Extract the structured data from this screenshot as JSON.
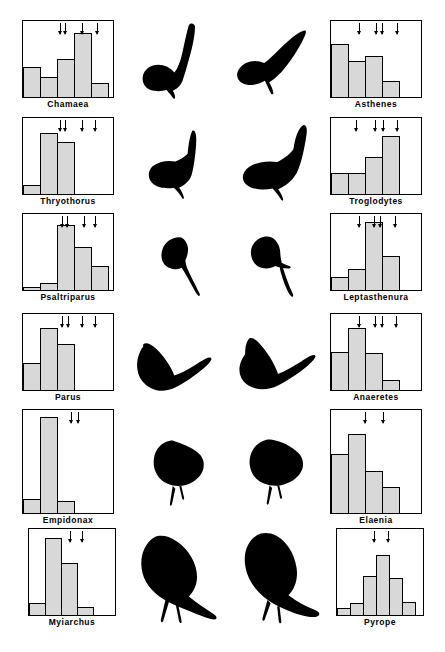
{
  "figure": {
    "accent_color": "#000000",
    "bar_fill_color": "#d8d8d8",
    "background_color": "#ffffff",
    "columns": {
      "left_label": "California genera",
      "right_label": "Chile genera"
    }
  },
  "chart_data": [
    {
      "type": "bar",
      "title": "Chamaea",
      "side": "left",
      "row": 1,
      "categories": [
        "1",
        "2",
        "3",
        "4",
        "5"
      ],
      "values": [
        40,
        27,
        52,
        86,
        19
      ],
      "ylim": [
        0,
        100
      ],
      "grid": false,
      "xlabel": "",
      "ylabel": "",
      "annotations": {
        "arrow_positions": [
          0.4,
          0.46,
          0.64,
          0.8
        ],
        "arrow_symbol": "down-arrow"
      }
    },
    {
      "type": "bar",
      "title": "Asthenes",
      "side": "right",
      "row": 1,
      "categories": [
        "1",
        "2",
        "3",
        "4"
      ],
      "values": [
        72,
        48,
        55,
        22
      ],
      "ylim": [
        0,
        100
      ],
      "grid": false,
      "xlabel": "",
      "ylabel": "",
      "annotations": {
        "arrow_positions": [
          0.3,
          0.49,
          0.55,
          0.72
        ],
        "arrow_symbol": "down-arrow"
      }
    },
    {
      "type": "bar",
      "title": "Thryothorus",
      "side": "left",
      "row": 2,
      "categories": [
        "1",
        "2",
        "3"
      ],
      "values": [
        12,
        82,
        70
      ],
      "ylim": [
        0,
        100
      ],
      "grid": false,
      "xlabel": "",
      "ylabel": "",
      "annotations": {
        "arrow_positions": [
          0.4,
          0.46,
          0.64,
          0.78
        ],
        "arrow_symbol": "down-arrow"
      }
    },
    {
      "type": "bar",
      "title": "Troglodytes",
      "side": "right",
      "row": 2,
      "categories": [
        "1",
        "2",
        "3",
        "4"
      ],
      "values": [
        28,
        28,
        50,
        78
      ],
      "ylim": [
        0,
        100
      ],
      "grid": false,
      "xlabel": "",
      "ylabel": "",
      "annotations": {
        "arrow_positions": [
          0.27,
          0.48,
          0.56,
          0.72
        ],
        "arrow_symbol": "down-arrow"
      }
    },
    {
      "type": "bar",
      "title": "Psaltriparus",
      "side": "left",
      "row": 3,
      "categories": [
        "1",
        "2",
        "3",
        "4",
        "5"
      ],
      "values": [
        4,
        10,
        88,
        58,
        32
      ],
      "ylim": [
        0,
        100
      ],
      "grid": false,
      "xlabel": "",
      "ylabel": "",
      "annotations": {
        "arrow_positions": [
          0.42,
          0.48,
          0.66,
          0.78
        ],
        "arrow_symbol": "down-arrow"
      }
    },
    {
      "type": "bar",
      "title": "Leptasthenura",
      "side": "right",
      "row": 3,
      "categories": [
        "1",
        "2",
        "3",
        "4"
      ],
      "values": [
        18,
        28,
        92,
        46
      ],
      "ylim": [
        0,
        100
      ],
      "grid": false,
      "xlabel": "",
      "ylabel": "",
      "annotations": {
        "arrow_positions": [
          0.3,
          0.47,
          0.53,
          0.7
        ],
        "arrow_symbol": "down-arrow"
      }
    },
    {
      "type": "bar",
      "title": "Parus",
      "side": "left",
      "row": 4,
      "categories": [
        "1",
        "2",
        "3"
      ],
      "values": [
        36,
        84,
        62
      ],
      "ylim": [
        0,
        100
      ],
      "grid": false,
      "xlabel": "",
      "ylabel": "",
      "annotations": {
        "arrow_positions": [
          0.42,
          0.49,
          0.64,
          0.78
        ],
        "arrow_symbol": "down-arrow"
      }
    },
    {
      "type": "bar",
      "title": "Anaeretes",
      "side": "right",
      "row": 4,
      "categories": [
        "1",
        "2",
        "3",
        "4"
      ],
      "values": [
        52,
        84,
        50,
        14
      ],
      "ylim": [
        0,
        100
      ],
      "grid": false,
      "xlabel": "",
      "ylabel": "",
      "annotations": {
        "arrow_positions": [
          0.3,
          0.48,
          0.55,
          0.71
        ],
        "arrow_symbol": "down-arrow"
      }
    },
    {
      "type": "bar",
      "title": "Empidonax",
      "side": "left",
      "row": 5,
      "categories": [
        "1",
        "2",
        "3"
      ],
      "values": [
        14,
        95,
        12
      ],
      "ylim": [
        0,
        100
      ],
      "grid": false,
      "xlabel": "",
      "ylabel": "",
      "annotations": {
        "arrow_positions": [
          0.52,
          0.6
        ],
        "arrow_symbol": "down-arrow"
      }
    },
    {
      "type": "bar",
      "title": "Elaenia",
      "side": "right",
      "row": 5,
      "categories": [
        "1",
        "2",
        "3",
        "4"
      ],
      "values": [
        58,
        78,
        42,
        26
      ],
      "ylim": [
        0,
        100
      ],
      "grid": false,
      "xlabel": "",
      "ylabel": "",
      "annotations": {
        "arrow_positions": [
          0.37,
          0.56
        ],
        "arrow_symbol": "down-arrow"
      }
    },
    {
      "type": "bar",
      "title": "Myiarchus",
      "side": "left",
      "row": 6,
      "categories": [
        "1",
        "2",
        "3",
        "4"
      ],
      "values": [
        14,
        92,
        62,
        10
      ],
      "ylim": [
        0,
        100
      ],
      "grid": false,
      "xlabel": "",
      "ylabel": "",
      "annotations": {
        "arrow_positions": [
          0.47,
          0.6
        ],
        "arrow_symbol": "down-arrow"
      }
    },
    {
      "type": "bar",
      "title": "Pyrope",
      "side": "right",
      "row": 6,
      "categories": [
        "1",
        "2",
        "3",
        "4",
        "5",
        "6"
      ],
      "values": [
        8,
        14,
        46,
        72,
        44,
        16
      ],
      "ylim": [
        0,
        100
      ],
      "grid": false,
      "xlabel": "",
      "ylabel": "",
      "annotations": {
        "arrow_positions": [
          0.42,
          0.58
        ],
        "arrow_symbol": "down-arrow"
      }
    }
  ],
  "silhouettes": [
    {
      "name": "wrentit-silhouette",
      "row": 1,
      "side": "left",
      "genus": "Chamaea"
    },
    {
      "name": "canastero-silhouette",
      "row": 1,
      "side": "right",
      "genus": "Asthenes"
    },
    {
      "name": "wren-silhouette",
      "row": 2,
      "side": "left",
      "genus": "Thryothorus"
    },
    {
      "name": "house-wren-silhouette",
      "row": 2,
      "side": "right",
      "genus": "Troglodytes"
    },
    {
      "name": "bushtit-silhouette",
      "row": 3,
      "side": "left",
      "genus": "Psaltriparus"
    },
    {
      "name": "tit-spinetail-silhouette",
      "row": 3,
      "side": "right",
      "genus": "Leptasthenura"
    },
    {
      "name": "titmouse-silhouette",
      "row": 4,
      "side": "left",
      "genus": "Parus"
    },
    {
      "name": "tit-tyrant-silhouette",
      "row": 4,
      "side": "right",
      "genus": "Anaeretes"
    },
    {
      "name": "flycatcher-silhouette",
      "row": 5,
      "side": "left",
      "genus": "Empidonax"
    },
    {
      "name": "elaenia-silhouette",
      "row": 5,
      "side": "right",
      "genus": "Elaenia"
    },
    {
      "name": "myiarchus-silhouette",
      "row": 6,
      "side": "left",
      "genus": "Myiarchus"
    },
    {
      "name": "pyrope-silhouette",
      "row": 6,
      "side": "right",
      "genus": "Pyrope"
    }
  ]
}
